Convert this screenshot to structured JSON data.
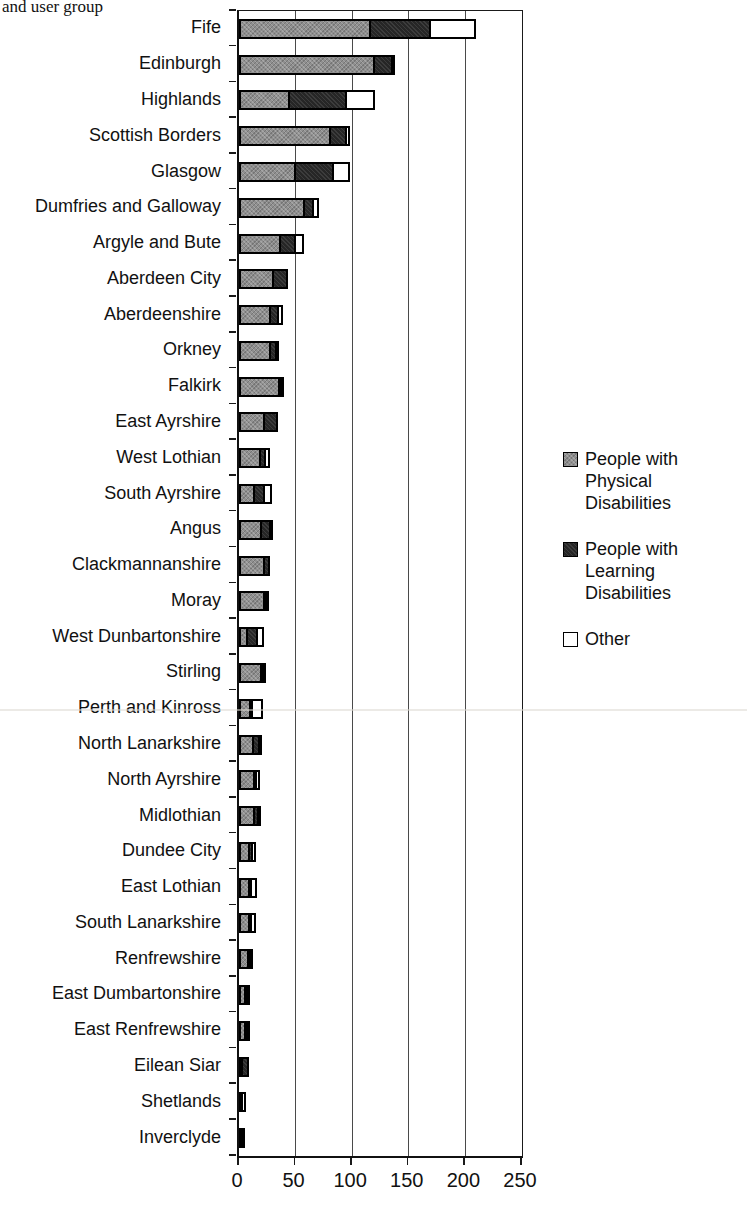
{
  "page": {
    "title_fragment": "and user group"
  },
  "chart_data": {
    "type": "bar",
    "orientation": "horizontal",
    "stacked": true,
    "title_partial": "and user group",
    "xlabel": "",
    "ylabel": "",
    "xlim": [
      0,
      250
    ],
    "x_ticks": [
      0,
      50,
      100,
      150,
      200,
      250
    ],
    "grid": "vertical gridlines every 50 units",
    "legend_position": "right",
    "categories": [
      "Fife",
      "Edinburgh",
      "Highlands",
      "Scottish Borders",
      "Glasgow",
      "Dumfries and Galloway",
      "Argyle and Bute",
      "Aberdeen City",
      "Aberdeenshire",
      "Orkney",
      "Falkirk",
      "East Ayrshire",
      "West Lothian",
      "South Ayrshire",
      "Angus",
      "Clackmannanshire",
      "Moray",
      "West Dunbartonshire",
      "Stirling",
      "Perth and Kinross",
      "North Lanarkshire",
      "North Ayrshire",
      "Midlothian",
      "Dundee City",
      "East Lothian",
      "South Lanarkshire",
      "Renfrewshire",
      "East Dumbartonshire",
      "East Renfrewshire",
      "Eilean Siar",
      "Shetlands",
      "Inverclyde"
    ],
    "series": [
      {
        "name": "People with Physical Disabilities",
        "color": "#8f8f8f",
        "values": [
          117,
          120,
          45,
          81,
          50,
          58,
          37,
          31,
          28,
          28,
          36,
          23,
          19,
          14,
          20,
          23,
          23,
          8,
          20,
          11,
          13,
          14,
          14,
          10,
          10,
          10,
          9,
          6,
          6,
          1,
          1,
          1
        ]
      },
      {
        "name": "People with Learning Disabilities",
        "color": "#262626",
        "values": [
          54,
          18,
          52,
          16,
          36,
          10,
          15,
          14,
          9,
          7,
          3,
          13,
          7,
          11,
          10,
          6,
          2,
          11,
          2,
          2,
          7,
          4,
          5,
          4,
          2,
          3,
          2,
          4,
          2,
          7,
          0,
          3
        ]
      },
      {
        "name": "Other",
        "color": "#ffffff",
        "values": [
          42,
          3,
          27,
          5,
          16,
          6,
          9,
          0,
          5,
          4,
          1,
          0,
          5,
          8,
          1,
          0,
          3,
          7,
          2,
          10,
          3,
          4,
          1,
          5,
          6,
          5,
          2,
          3,
          4,
          0,
          4,
          0
        ]
      }
    ]
  },
  "legend": {
    "entries": [
      {
        "label": "People with\nPhysical\nDisabilities",
        "color": "#8f8f8f",
        "swatch": "gray-dotted"
      },
      {
        "label": "People with\nLearning\nDisabilities",
        "color": "#262626",
        "swatch": "dark-dotted"
      },
      {
        "label": "Other",
        "color": "#ffffff",
        "swatch": "white"
      }
    ]
  }
}
